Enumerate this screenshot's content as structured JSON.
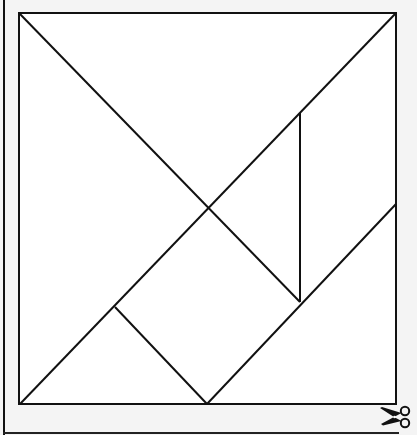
{
  "document": {
    "type": "tangram-cutout-sheet",
    "pieces": [
      {
        "name": "large-triangle-left",
        "points": [
          [
            19,
            13
          ],
          [
            208,
            208
          ],
          [
            20,
            404
          ]
        ]
      },
      {
        "name": "large-triangle-top",
        "points": [
          [
            19,
            13
          ],
          [
            396,
            13
          ],
          [
            208,
            208
          ]
        ]
      },
      {
        "name": "parallelogram",
        "points": [
          [
            300,
            113
          ],
          [
            396,
            13
          ],
          [
            396,
            204
          ],
          [
            300,
            302
          ]
        ]
      },
      {
        "name": "small-triangle-middle",
        "points": [
          [
            208,
            208
          ],
          [
            300,
            113
          ],
          [
            300,
            302
          ]
        ]
      },
      {
        "name": "square",
        "points": [
          [
            208,
            208
          ],
          [
            300,
            302
          ],
          [
            207,
            404
          ],
          [
            115,
            307
          ]
        ]
      },
      {
        "name": "small-triangle-bottom",
        "points": [
          [
            20,
            404
          ],
          [
            115,
            307
          ],
          [
            207,
            404
          ]
        ]
      },
      {
        "name": "medium-triangle",
        "points": [
          [
            396,
            204
          ],
          [
            396,
            404
          ],
          [
            207,
            404
          ]
        ]
      }
    ],
    "cut_icon": "scissors-icon",
    "line_color": "#111111",
    "background_color": "#f4f4f4",
    "square_fill": "#ffffff"
  }
}
